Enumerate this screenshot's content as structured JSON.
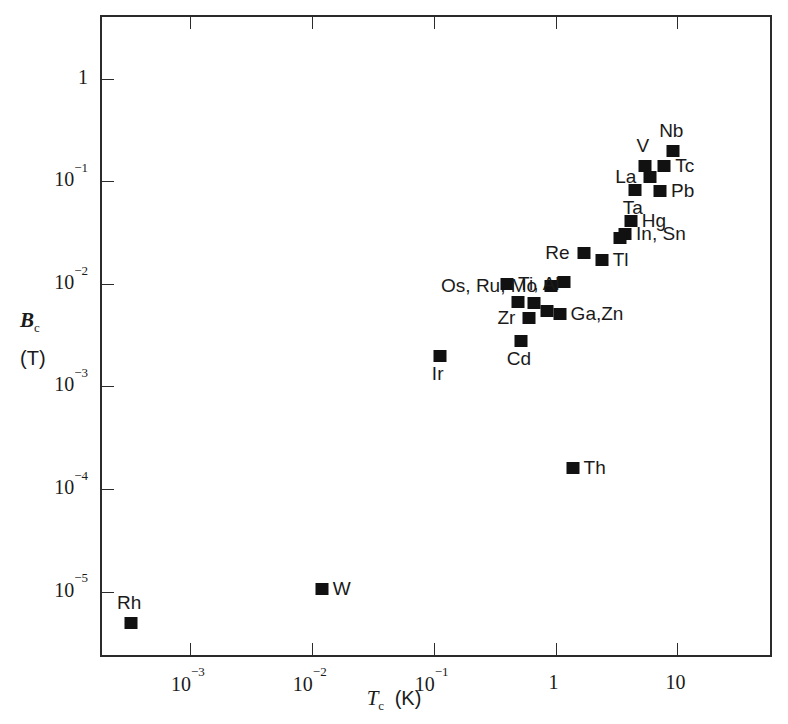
{
  "chart_data": {
    "type": "scatter",
    "title": "",
    "xlabel": "T_c  (K)",
    "ylabel": "B_c  (T)",
    "xlabel_parts": {
      "symbol": "T",
      "sub": "c",
      "unit": "(K)"
    },
    "ylabel_parts": {
      "symbol": "B",
      "sub": "c",
      "unit": "(T)"
    },
    "xscale": "log",
    "yscale": "log",
    "grid": false,
    "legend": "none",
    "xlim": [
      0.00019,
      62
    ],
    "ylim": [
      2.2e-06,
      4.0
    ],
    "xticks": [
      {
        "value": 0.001,
        "label": "10",
        "exp": "−3"
      },
      {
        "value": 0.01,
        "label": "10",
        "exp": "−2"
      },
      {
        "value": 0.1,
        "label": "10",
        "exp": "−1"
      },
      {
        "value": 1,
        "label": "1",
        "exp": ""
      },
      {
        "value": 10,
        "label": "10",
        "exp": ""
      }
    ],
    "yticks": [
      {
        "value": 1,
        "label": "1",
        "exp": ""
      },
      {
        "value": 0.1,
        "label": "10",
        "exp": "−1"
      },
      {
        "value": 0.01,
        "label": "10",
        "exp": "−2"
      },
      {
        "value": 0.001,
        "label": "10",
        "exp": "−3"
      },
      {
        "value": 0.0001,
        "label": "10",
        "exp": "−4"
      },
      {
        "value": 1e-05,
        "label": "10",
        "exp": "−5"
      }
    ],
    "marker_color": "#111111",
    "marker_shape": "square",
    "points": [
      {
        "name": "Rh",
        "x": 0.00033,
        "y": 4.9e-06,
        "label": "Rh",
        "label_pos": "above"
      },
      {
        "name": "W",
        "x": 0.0121,
        "y": 1.07e-05,
        "label": "W",
        "label_pos": "right"
      },
      {
        "name": "Ir",
        "x": 0.112,
        "y": 0.002,
        "label": "Ir",
        "label_pos": "below"
      },
      {
        "name": "Th",
        "x": 1.38,
        "y": 0.00016,
        "label": "Th",
        "label_pos": "right"
      },
      {
        "name": "Mo",
        "x": 0.92,
        "y": 0.0096,
        "label": "Os, Ru, Mo",
        "label_pos": "left"
      },
      {
        "name": "Os",
        "x": 0.66,
        "y": 0.0065,
        "label": "",
        "label_pos": "none"
      },
      {
        "name": "Ru",
        "x": 0.49,
        "y": 0.0066,
        "label": "",
        "label_pos": "none"
      },
      {
        "name": "Zr",
        "x": 0.61,
        "y": 0.0047,
        "label": "Zr",
        "label_pos": "left"
      },
      {
        "name": "Cd",
        "x": 0.52,
        "y": 0.0028,
        "label": "Cd",
        "label_pos": "below"
      },
      {
        "name": "Ti",
        "x": 0.4,
        "y": 0.01,
        "label": "Ti, Al",
        "label_pos": "right"
      },
      {
        "name": "Al",
        "x": 1.18,
        "y": 0.0105,
        "label": "",
        "label_pos": "none"
      },
      {
        "name": "Ga",
        "x": 1.08,
        "y": 0.0051,
        "label": "Ga,Zn",
        "label_pos": "right"
      },
      {
        "name": "Zn",
        "x": 0.85,
        "y": 0.0054,
        "label": "",
        "label_pos": "none"
      },
      {
        "name": "Re",
        "x": 1.7,
        "y": 0.02,
        "label": "Re",
        "label_pos": "left"
      },
      {
        "name": "Tl",
        "x": 2.39,
        "y": 0.017,
        "label": "Tl",
        "label_pos": "right"
      },
      {
        "name": "Sn",
        "x": 3.72,
        "y": 0.0305,
        "label": "In, Sn",
        "label_pos": "right"
      },
      {
        "name": "In",
        "x": 3.41,
        "y": 0.028,
        "label": "",
        "label_pos": "none"
      },
      {
        "name": "Hg",
        "x": 4.15,
        "y": 0.041,
        "label": "Hg",
        "label_pos": "right"
      },
      {
        "name": "Ta",
        "x": 4.48,
        "y": 0.083,
        "label": "Ta",
        "label_pos": "below"
      },
      {
        "name": "Pb",
        "x": 7.19,
        "y": 0.08,
        "label": "Pb",
        "label_pos": "right"
      },
      {
        "name": "La",
        "x": 6.0,
        "y": 0.11,
        "label": "La",
        "label_pos": "left"
      },
      {
        "name": "V",
        "x": 5.4,
        "y": 0.142,
        "label": "V",
        "label_pos": "above"
      },
      {
        "name": "Tc",
        "x": 7.8,
        "y": 0.141,
        "label": "Tc",
        "label_pos": "right"
      },
      {
        "name": "Nb",
        "x": 9.25,
        "y": 0.198,
        "label": "Nb",
        "label_pos": "above"
      }
    ]
  }
}
